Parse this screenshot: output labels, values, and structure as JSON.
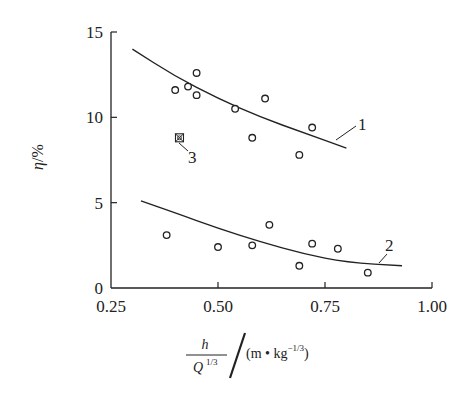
{
  "chart_data": {
    "type": "scatter",
    "title": "",
    "xlabel": "h/Q^{1/3} / (m·kg^{-1/3})",
    "ylabel": "η/%",
    "xlim": [
      0.25,
      1.0
    ],
    "ylim": [
      0,
      15
    ],
    "xticks": [
      "0.25",
      "0.50",
      "0.75",
      "1.00"
    ],
    "yticks": [
      "0",
      "5",
      "10",
      "15"
    ],
    "grid": false,
    "legend": "none (curves labeled inline 1, 2, 3)",
    "series": [
      {
        "name": "1",
        "kind": "scatter+fit",
        "marker": "open-circle",
        "points": [
          {
            "x": 0.4,
            "y": 11.6
          },
          {
            "x": 0.43,
            "y": 11.8
          },
          {
            "x": 0.45,
            "y": 12.6
          },
          {
            "x": 0.45,
            "y": 11.3
          },
          {
            "x": 0.54,
            "y": 10.5
          },
          {
            "x": 0.58,
            "y": 8.8
          },
          {
            "x": 0.61,
            "y": 11.1
          },
          {
            "x": 0.69,
            "y": 7.8
          },
          {
            "x": 0.72,
            "y": 9.4
          }
        ],
        "fit_curve": [
          {
            "x": 0.3,
            "y": 14.0
          },
          {
            "x": 0.4,
            "y": 12.4
          },
          {
            "x": 0.5,
            "y": 11.1
          },
          {
            "x": 0.6,
            "y": 10.0
          },
          {
            "x": 0.7,
            "y": 9.1
          },
          {
            "x": 0.8,
            "y": 8.2
          }
        ]
      },
      {
        "name": "2",
        "kind": "scatter+fit",
        "marker": "open-circle",
        "points": [
          {
            "x": 0.38,
            "y": 3.1
          },
          {
            "x": 0.5,
            "y": 2.4
          },
          {
            "x": 0.58,
            "y": 2.5
          },
          {
            "x": 0.62,
            "y": 3.7
          },
          {
            "x": 0.69,
            "y": 1.3
          },
          {
            "x": 0.72,
            "y": 2.6
          },
          {
            "x": 0.78,
            "y": 2.3
          },
          {
            "x": 0.85,
            "y": 0.9
          }
        ],
        "fit_curve": [
          {
            "x": 0.32,
            "y": 5.1
          },
          {
            "x": 0.4,
            "y": 4.4
          },
          {
            "x": 0.5,
            "y": 3.5
          },
          {
            "x": 0.6,
            "y": 2.7
          },
          {
            "x": 0.7,
            "y": 2.0
          },
          {
            "x": 0.8,
            "y": 1.5
          },
          {
            "x": 0.93,
            "y": 1.3
          }
        ]
      },
      {
        "name": "3",
        "kind": "scatter",
        "marker": "crossed-square",
        "points": [
          {
            "x": 0.41,
            "y": 8.8
          }
        ]
      }
    ],
    "annotations": [
      {
        "text": "1",
        "near": {
          "x": 0.84,
          "y": 9.5
        }
      },
      {
        "text": "2",
        "near": {
          "x": 0.9,
          "y": 2.5
        }
      },
      {
        "text": "3",
        "near": {
          "x": 0.45,
          "y": 7.7
        }
      }
    ]
  },
  "axes": {
    "y_label_symbol": "η",
    "y_label_unit": "/%",
    "x_label_numerator": "h",
    "x_label_denominator": "Q",
    "x_label_denominator_exp": "1/3",
    "x_label_unit_open": "(m • kg",
    "x_label_unit_exp": "−1/3",
    "x_label_unit_close": ")"
  },
  "colors": {
    "ink": "#222222",
    "background": "#ffffff"
  }
}
